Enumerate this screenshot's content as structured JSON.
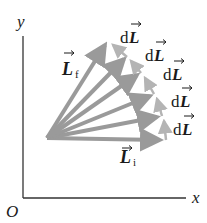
{
  "diagram": {
    "type": "vector-diagram",
    "axes": {
      "y_label": "y",
      "x_label": "x",
      "origin_label": "O"
    },
    "vectors": {
      "initial": {
        "symbol": "L",
        "subscript": "i"
      },
      "final": {
        "symbol": "L",
        "subscript": "f"
      },
      "increments": [
        {
          "prefix": "d",
          "symbol": "L"
        },
        {
          "prefix": "d",
          "symbol": "L"
        },
        {
          "prefix": "d",
          "symbol": "L"
        },
        {
          "prefix": "d",
          "symbol": "L"
        },
        {
          "prefix": "d",
          "symbol": "L"
        }
      ]
    },
    "colors": {
      "vector": "#9a9a9a",
      "increment": "#b4b4b4",
      "axis": "#333333",
      "text": "#1a1a1a"
    }
  }
}
